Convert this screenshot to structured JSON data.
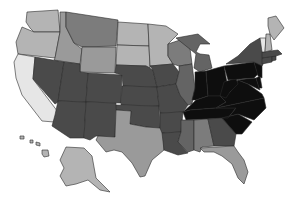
{
  "map": {
    "type": "choropleth",
    "region": "United States",
    "legend": null,
    "shades": {
      "lightest": "#e6e6e6",
      "light": "#b4b4b4",
      "medium_light": "#9a9a9a",
      "medium": "#7c7c7c",
      "medium_dark": "#646464",
      "dark": "#4a4a4a",
      "darkest": "#0e0e0e"
    },
    "states": [
      {
        "id": "WA",
        "shade": "light",
        "d": "M27,12 L58,10 L60,32 L34,32 L30,28 L26,22 Z"
      },
      {
        "id": "OR",
        "shade": "light",
        "d": "M22,27 L34,32 L60,32 L55,58 L18,54 L16,42 Z"
      },
      {
        "id": "CA",
        "shade": "lightest",
        "d": "M18,54 L35,57 L33,79 L58,112 L54,122 L42,121 L32,108 L22,95 L16,78 L14,62 Z"
      },
      {
        "id": "ID",
        "shade": "medium_light",
        "d": "M60,12 L66,12 L66,27 L74,43 L82,49 L80,64 L54,60 L55,58 L60,32 Z"
      },
      {
        "id": "NV",
        "shade": "dark",
        "d": "M35,57 L64,62 L58,102 L55,104 L33,79 Z"
      },
      {
        "id": "MT",
        "shade": "medium",
        "d": "M66,12 L118,20 L116,46 L82,47 L74,43 L66,27 Z"
      },
      {
        "id": "WY",
        "shade": "medium_light",
        "d": "M82,47 L116,47 L115,73 L80,72 Z"
      },
      {
        "id": "UT",
        "shade": "dark",
        "d": "M64,62 L80,64 L80,72 L88,73 L86,102 L58,101 Z"
      },
      {
        "id": "AZ",
        "shade": "dark",
        "d": "M58,101 L86,102 L84,138 L70,138 L52,126 L55,115 Z"
      },
      {
        "id": "CO",
        "shade": "dark",
        "d": "M88,73 L122,75 L121,103 L86,102 Z"
      },
      {
        "id": "NM",
        "shade": "dark",
        "d": "M86,102 L116,103 L115,137 L96,136 L90,140 L84,138 Z"
      },
      {
        "id": "ND",
        "shade": "light",
        "d": "M118,22 L148,24 L149,46 L117,45 Z"
      },
      {
        "id": "SD",
        "shade": "light",
        "d": "M117,45 L149,46 L150,68 L146,66 L116,65 Z"
      },
      {
        "id": "NE",
        "shade": "dark",
        "d": "M116,65 L146,66 L153,70 L157,87 L123,86 L122,75 L115,73 Z"
      },
      {
        "id": "KS",
        "shade": "dark",
        "d": "M122,86 L157,87 L159,106 L121,105 Z"
      },
      {
        "id": "OK",
        "shade": "dark",
        "d": "M116,105 L159,106 L160,128 L146,127 L130,124 L131,111 L116,110 Z"
      },
      {
        "id": "TX",
        "shade": "medium_light",
        "d": "M116,110 L131,111 L130,124 L146,127 L160,128 L164,132 L164,150 L152,160 L145,176 L140,177 L132,163 L122,152 L114,150 L106,152 L96,140 L98,136 L115,137 Z"
      },
      {
        "id": "MN",
        "shade": "light",
        "d": "M148,24 L166,26 L178,34 L168,44 L168,56 L173,64 L150,66 L149,46 Z"
      },
      {
        "id": "IA",
        "shade": "dark",
        "d": "M150,66 L173,64 L179,72 L176,84 L157,87 L153,70 Z"
      },
      {
        "id": "MO",
        "shade": "dark",
        "d": "M157,87 L176,84 L180,95 L188,105 L183,112 L160,113 L159,106 Z"
      },
      {
        "id": "AR",
        "shade": "dark",
        "d": "M160,113 L183,112 L181,132 L162,133 L160,128 Z"
      },
      {
        "id": "LA",
        "shade": "dark",
        "d": "M162,133 L181,132 L178,142 L188,153 L178,155 L164,150 Z"
      },
      {
        "id": "WI",
        "shade": "medium",
        "d": "M168,44 L180,40 L190,48 L192,64 L179,66 L173,64 L168,56 Z"
      },
      {
        "id": "IL",
        "shade": "medium_dark",
        "d": "M179,66 L192,64 L195,88 L192,104 L188,105 L180,95 L176,84 L179,72 Z"
      },
      {
        "id": "MI",
        "shade": "medium_dark",
        "d": "M176,38 L198,34 L210,44 L200,44 L196,52 L200,54 L209,55 L212,68 L200,72 L194,68 L196,54 Z"
      },
      {
        "id": "IN",
        "shade": "darkest",
        "d": "M195,72 L206,71 L208,96 L196,100 L192,100 L195,88 Z"
      },
      {
        "id": "OH",
        "shade": "darkest",
        "d": "M206,71 L224,66 L228,88 L220,96 L208,96 Z"
      },
      {
        "id": "KY",
        "shade": "darkest",
        "d": "M183,112 L192,104 L196,100 L208,96 L220,96 L226,102 L216,108 L190,110 Z"
      },
      {
        "id": "TN",
        "shade": "darkest",
        "d": "M183,112 L190,110 L216,108 L236,108 L228,118 L186,120 Z"
      },
      {
        "id": "MS",
        "shade": "medium_dark",
        "d": "M181,120 L194,120 L194,150 L188,152 L178,142 L181,132 Z"
      },
      {
        "id": "AL",
        "shade": "medium",
        "d": "M194,120 L208,119 L214,146 L202,147 L200,152 L194,150 Z"
      },
      {
        "id": "GA",
        "shade": "dark",
        "d": "M208,119 L222,118 L236,134 L234,146 L214,146 Z"
      },
      {
        "id": "FL",
        "shade": "medium_light",
        "d": "M200,148 L234,146 L238,152 L244,160 L248,172 L244,184 L238,178 L232,164 L222,156 L214,152 L204,152 Z"
      },
      {
        "id": "SC",
        "shade": "darkest",
        "d": "M222,118 L238,114 L252,122 L242,134 L236,134 Z"
      },
      {
        "id": "NC",
        "shade": "darkest",
        "d": "M216,108 L264,98 L266,108 L254,120 L238,114 L222,118 L228,118 L236,108 Z"
      },
      {
        "id": "VA",
        "shade": "darkest",
        "d": "M220,96 L230,92 L238,80 L248,84 L262,94 L264,98 L216,108 L226,102 Z"
      },
      {
        "id": "WV",
        "shade": "darkest",
        "d": "M224,82 L236,78 L238,84 L230,92 L226,98 L220,96 Z"
      },
      {
        "id": "PA",
        "shade": "darkest",
        "d": "M224,66 L254,62 L258,74 L254,78 L228,80 Z"
      },
      {
        "id": "MD",
        "shade": "darkest",
        "d": "M236,80 L256,78 L260,90 L252,86 L248,84 L238,80 Z"
      },
      {
        "id": "DE",
        "shade": "darkest",
        "d": "M256,78 L260,76 L262,88 L259,88 Z"
      },
      {
        "id": "NJ",
        "shade": "darkest",
        "d": "M254,62 L262,64 L262,78 L258,76 Z"
      },
      {
        "id": "NY",
        "shade": "dark",
        "d": "M226,64 L238,56 L250,44 L260,38 L264,48 L264,62 L262,66 L254,62 Z"
      },
      {
        "id": "CT",
        "shade": "dark",
        "d": "M262,58 L272,56 L272,62 L262,64 Z"
      },
      {
        "id": "RI",
        "shade": "dark",
        "d": "M272,56 L276,56 L276,60 L272,61 Z"
      },
      {
        "id": "MA",
        "shade": "dark",
        "d": "M262,52 L278,50 L282,54 L276,56 L262,58 Z"
      },
      {
        "id": "VT",
        "shade": "lightest",
        "d": "M260,38 L266,38 L265,52 L262,52 Z"
      },
      {
        "id": "NH",
        "shade": "light",
        "d": "M266,34 L270,34 L272,50 L265,52 Z"
      },
      {
        "id": "ME",
        "shade": "light",
        "d": "M268,18 L276,16 L284,28 L274,40 L270,34 L268,26 Z"
      },
      {
        "id": "AK",
        "shade": "light",
        "d": "M66,147 L84,148 L92,156 L96,178 L110,192 L100,190 L88,180 L76,184 L66,186 L60,176 L64,168 L60,160 Z"
      },
      {
        "id": "HI",
        "shade": "light",
        "d": "M20,136 L24,136 L24,139 L20,139 Z M30,140 L33,140 L33,143 L30,143 Z M36,142 L40,143 L40,146 L36,145 Z M42,150 L48,150 L49,156 L44,157 L42,154 Z"
      }
    ]
  }
}
